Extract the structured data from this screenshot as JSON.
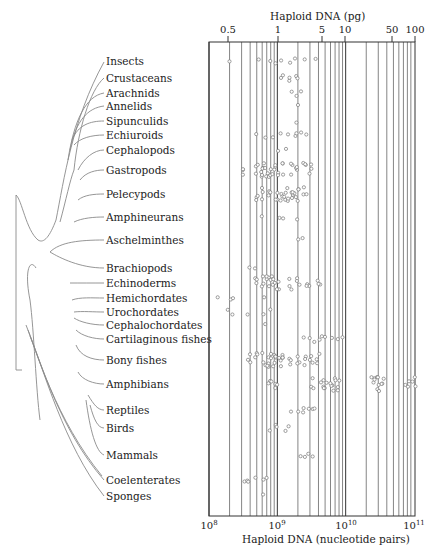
{
  "chart_data": {
    "type": "scatter",
    "title": "",
    "top_axis": {
      "label": "Haploid DNA (pg)",
      "ticks": [
        "0.5",
        "1",
        "5",
        "10",
        "50",
        "100"
      ],
      "tick_values": [
        0.5,
        1,
        5,
        10,
        50,
        100
      ]
    },
    "bottom_axis": {
      "label": "Haploid DNA (nucleotide pairs)",
      "scale": "log",
      "ticks": [
        "10^8",
        "10^9",
        "10^10",
        "10^11"
      ],
      "tick_values": [
        100000000,
        1000000000,
        10000000000,
        100000000000
      ],
      "xlim": [
        100000000,
        100000000000
      ]
    },
    "grid": "vertical log gridlines",
    "taxa": [
      {
        "name": "Insects",
        "log10_range": [
          8.3,
          9.6
        ],
        "points_log10": [
          8.3,
          8.75,
          8.9,
          9.0,
          9.05,
          9.2,
          9.25,
          9.4,
          9.55
        ]
      },
      {
        "name": "Crustaceans",
        "log10_range": [
          9.05,
          9.35
        ],
        "points_log10": [
          9.05,
          9.1,
          9.15,
          9.2,
          9.25,
          9.3
        ]
      },
      {
        "name": "Arachnids",
        "log10_range": [
          9.2,
          9.3
        ],
        "points_log10": [
          9.2,
          9.3,
          9.35
        ]
      },
      {
        "name": "Annelids",
        "log10_range": [
          9.3,
          9.3
        ],
        "points_log10": [
          9.3
        ]
      },
      {
        "name": "Sipunculids",
        "log10_range": [
          9.3,
          9.3
        ],
        "points_log10": [
          9.3
        ]
      },
      {
        "name": "Echiuroids",
        "log10_range": [
          8.7,
          9.5
        ],
        "points_log10": [
          8.7,
          8.85,
          8.95,
          9.05,
          9.15,
          9.25,
          9.3,
          9.35,
          9.45
        ]
      },
      {
        "name": "Cephalopods",
        "log10_range": [
          9.0,
          9.1
        ],
        "points_log10": [
          9.0,
          9.1
        ]
      },
      {
        "name": "Gastropods",
        "log10_range": [
          8.5,
          9.6
        ],
        "points_log10": [
          8.5,
          8.7,
          8.75,
          8.8,
          8.85,
          8.9,
          8.95,
          9.0,
          9.1,
          9.2,
          9.3,
          9.4,
          9.5
        ]
      },
      {
        "name": "Pelecypods",
        "log10_range": [
          8.7,
          9.4
        ],
        "points_log10": [
          8.7,
          8.8,
          8.9,
          9.0,
          9.05,
          9.1,
          9.15,
          9.2,
          9.25,
          9.3,
          9.4
        ]
      },
      {
        "name": "Amphineurans",
        "log10_range": [
          8.8,
          9.3
        ],
        "points_log10": [
          8.8,
          9.05,
          9.1,
          9.3
        ]
      },
      {
        "name": "Aschelminthes",
        "log10_range": [
          9.3,
          9.35
        ],
        "points_log10": [
          9.3,
          9.35
        ]
      },
      {
        "name": "Brachiopods",
        "log10_range": [
          8.6,
          8.65
        ],
        "points_log10": [
          8.6,
          8.65
        ]
      },
      {
        "name": "Echinoderms",
        "log10_range": [
          8.7,
          9.6
        ],
        "points_log10": [
          8.7,
          8.8,
          8.85,
          8.9,
          8.95,
          9.0,
          9.2,
          9.3,
          9.45,
          9.6
        ]
      },
      {
        "name": "Hemichordates",
        "log10_range": [
          8.15,
          8.8
        ],
        "points_log10": [
          8.15,
          8.3,
          8.35,
          8.8
        ]
      },
      {
        "name": "Urochordates",
        "log10_range": [
          8.3,
          8.9
        ],
        "points_log10": [
          8.3,
          8.35,
          8.55,
          8.8,
          8.9
        ]
      },
      {
        "name": "Cephalochordates",
        "log10_range": [
          8.8,
          8.8
        ],
        "points_log10": [
          8.8
        ]
      },
      {
        "name": "Cartilaginous fishes",
        "log10_range": [
          9.4,
          9.95
        ],
        "points_log10": [
          9.4,
          9.5,
          9.55,
          9.6,
          9.65,
          9.7,
          9.8,
          9.9,
          9.95
        ]
      },
      {
        "name": "Bony fishes",
        "log10_range": [
          8.6,
          9.6
        ],
        "points_log10": [
          8.6,
          8.7,
          8.8,
          8.85,
          8.9,
          8.95,
          9.0,
          9.05,
          9.1,
          9.2,
          9.3,
          9.4,
          9.5,
          9.6
        ]
      },
      {
        "name": "Amphibians",
        "log10_range": [
          8.9,
          11.0
        ],
        "points_log10": [
          8.9,
          9.0,
          9.5,
          9.65,
          9.7,
          9.8,
          9.85,
          9.9,
          10.4,
          10.45,
          10.5,
          10.55,
          10.9,
          11.0
        ]
      },
      {
        "name": "Reptiles",
        "log10_range": [
          9.2,
          9.55
        ],
        "points_log10": [
          9.2,
          9.3,
          9.35,
          9.4,
          9.45,
          9.5,
          9.55
        ]
      },
      {
        "name": "Birds",
        "log10_range": [
          8.9,
          9.15
        ],
        "points_log10": [
          8.9,
          8.95,
          9.0,
          9.1,
          9.15
        ]
      },
      {
        "name": "Mammals",
        "log10_range": [
          9.35,
          9.5
        ],
        "points_log10": [
          9.35,
          9.4,
          9.45,
          9.5
        ]
      },
      {
        "name": "Coelenterates",
        "log10_range": [
          8.5,
          8.85
        ],
        "points_log10": [
          8.5,
          8.55,
          8.6,
          8.65,
          8.8,
          8.85
        ]
      },
      {
        "name": "Sponges",
        "log10_range": [
          8.8,
          8.8
        ],
        "points_log10": [
          8.8
        ]
      }
    ]
  },
  "labels": {
    "top_axis_title": "Haploid DNA (pg)",
    "bottom_axis_title": "Haploid DNA (nucleotide pairs)",
    "top_ticks": [
      {
        "text": "0.5",
        "x": 228
      },
      {
        "text": "1",
        "x": 278
      },
      {
        "text": "5",
        "x": 322
      },
      {
        "text": "10",
        "x": 345
      },
      {
        "text": "50",
        "x": 392
      },
      {
        "text": "100",
        "x": 415
      }
    ],
    "bottom_ticks": [
      {
        "base": "10",
        "exp": "8",
        "x": 209
      },
      {
        "base": "10",
        "exp": "9",
        "x": 277
      },
      {
        "base": "10",
        "exp": "10",
        "x": 346
      },
      {
        "base": "10",
        "exp": "11",
        "x": 414
      }
    ]
  },
  "taxa_rows": [
    {
      "name": "Insects",
      "y": 61
    },
    {
      "name": "Crustaceans",
      "y": 78
    },
    {
      "name": "Arachnids",
      "y": 93
    },
    {
      "name": "Annelids",
      "y": 106
    },
    {
      "name": "Sipunculids",
      "y": 121
    },
    {
      "name": "Echiuroids",
      "y": 135
    },
    {
      "name": "Cephalopods",
      "y": 150
    },
    {
      "name": "Gastropods",
      "y": 170
    },
    {
      "name": "Pelecypods",
      "y": 194
    },
    {
      "name": "Amphineurans",
      "y": 217
    },
    {
      "name": "Aschelminthes",
      "y": 240
    },
    {
      "name": "Brachiopods",
      "y": 268
    },
    {
      "name": "Echinoderms",
      "y": 283
    },
    {
      "name": "Hemichordates",
      "y": 298
    },
    {
      "name": "Urochordates",
      "y": 312
    },
    {
      "name": "Cephalochordates",
      "y": 325
    },
    {
      "name": "Cartilaginous fishes",
      "y": 339
    },
    {
      "name": "Bony fishes",
      "y": 360
    },
    {
      "name": "Amphibians",
      "y": 384
    },
    {
      "name": "Reptiles",
      "y": 410
    },
    {
      "name": "Birds",
      "y": 428
    },
    {
      "name": "Mammals",
      "y": 455
    },
    {
      "name": "Coelenterates",
      "y": 480
    },
    {
      "name": "Sponges",
      "y": 496
    }
  ],
  "colors": {
    "ink": "#2a2a2a",
    "grid": "#555555",
    "dot": "#777777",
    "tree": "#888888"
  }
}
